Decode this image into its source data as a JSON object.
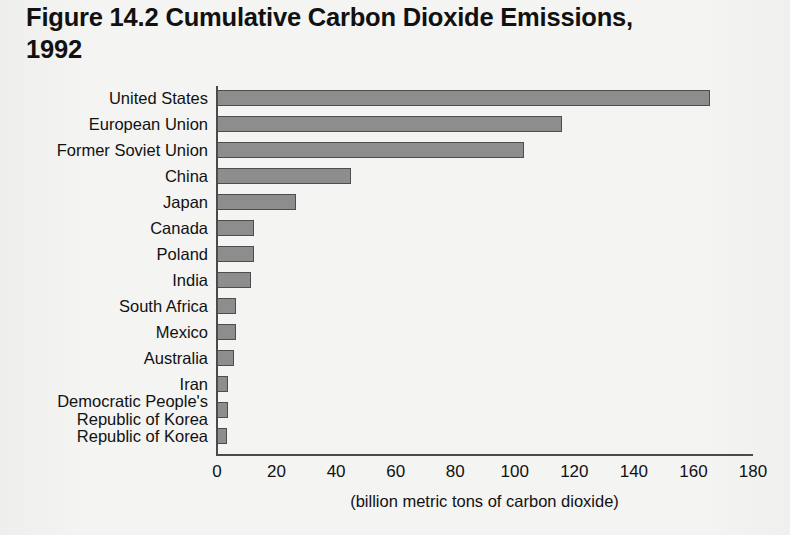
{
  "title": {
    "figure_number": "Figure 14.2",
    "text": "Cumulative Carbon Dioxide Emissions,",
    "line2": "1992"
  },
  "colors": {
    "bar_fill": "#8d8d8d",
    "bar_border": "#4d4d4d",
    "axis": "#4a4a4a",
    "background": "#f4f4f2",
    "text": "#111111"
  },
  "axis": {
    "caption": "(billion metric tons of carbon dioxide)",
    "ticks": [
      "0",
      "20",
      "40",
      "60",
      "80",
      "100",
      "120",
      "140",
      "160",
      "180"
    ]
  },
  "chart_data": {
    "type": "bar",
    "orientation": "horizontal",
    "xlabel": "(billion metric tons of carbon dioxide)",
    "ylabel": "",
    "xlim": [
      0,
      180
    ],
    "xticks": [
      0,
      20,
      40,
      60,
      80,
      100,
      120,
      140,
      160,
      180
    ],
    "grid": false,
    "legend": false,
    "units": "billion metric tons of carbon dioxide",
    "categories": [
      "United States",
      "European Union",
      "Former Soviet Union",
      "China",
      "Japan",
      "Canada",
      "Poland",
      "India",
      "South Africa",
      "Mexico",
      "Australia",
      "Iran",
      "Democratic People's Republic of Korea",
      "Republic of Korea"
    ],
    "values": [
      165.5,
      116,
      103,
      45,
      26.5,
      12.5,
      12.5,
      11.5,
      6.5,
      6.3,
      5.8,
      3.6,
      3.6,
      3.4
    ]
  },
  "rows": [
    {
      "label": "United States",
      "label_line2": "",
      "value": 165.5
    },
    {
      "label": "European Union",
      "label_line2": "",
      "value": 116
    },
    {
      "label": "Former Soviet Union",
      "label_line2": "",
      "value": 103
    },
    {
      "label": "China",
      "label_line2": "",
      "value": 45
    },
    {
      "label": "Japan",
      "label_line2": "",
      "value": 26.5
    },
    {
      "label": "Canada",
      "label_line2": "",
      "value": 12.5
    },
    {
      "label": "Poland",
      "label_line2": "",
      "value": 12.5
    },
    {
      "label": "India",
      "label_line2": "",
      "value": 11.5
    },
    {
      "label": "South Africa",
      "label_line2": "",
      "value": 6.5
    },
    {
      "label": "Mexico",
      "label_line2": "",
      "value": 6.3
    },
    {
      "label": "Australia",
      "label_line2": "",
      "value": 5.8
    },
    {
      "label": "Iran",
      "label_line2": "",
      "value": 3.6
    },
    {
      "label": "Democratic People's",
      "label_line2": "Republic of Korea",
      "value": 3.6
    },
    {
      "label": "Republic of Korea",
      "label_line2": "",
      "value": 3.4
    }
  ]
}
